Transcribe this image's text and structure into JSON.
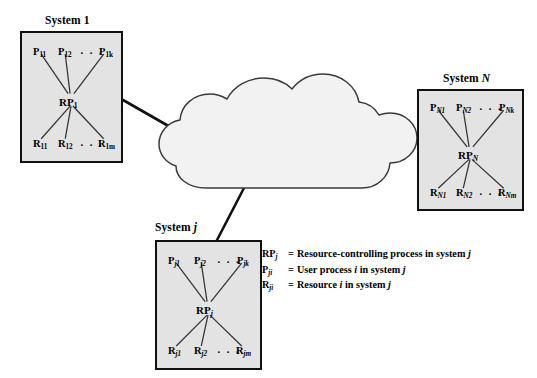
{
  "figure": {
    "background_color": "#ffffff",
    "box_fill": "#e3e3e3",
    "line_color": "#111111"
  },
  "cloud": {
    "label": "network-cloud",
    "fill": "#f2f2f2",
    "stroke": "#3a3a3a"
  },
  "systems": [
    {
      "id": "system-1",
      "title_prefix": "System",
      "title_index": "1",
      "title_index_italic": false,
      "processes": [
        {
          "base": "P",
          "sub": "11"
        },
        {
          "base": "P",
          "sub": "12"
        },
        {
          "base": "P",
          "sub": "1k"
        }
      ],
      "process_dots": "· · ·",
      "controller": {
        "base": "RP",
        "sub": "1",
        "sub_italic": false
      },
      "resources": [
        {
          "base": "R",
          "sub": "11"
        },
        {
          "base": "R",
          "sub": "12"
        },
        {
          "base": "R",
          "sub": "1m"
        }
      ],
      "resource_dots": "· · ·"
    },
    {
      "id": "system-N",
      "title_prefix": "System",
      "title_index": "N",
      "title_index_italic": true,
      "processes": [
        {
          "base": "P",
          "sub": "N1"
        },
        {
          "base": "P",
          "sub": "N2"
        },
        {
          "base": "P",
          "sub": "Nk"
        }
      ],
      "process_dots": "· · ·",
      "controller": {
        "base": "RP",
        "sub": "N",
        "sub_italic": true
      },
      "resources": [
        {
          "base": "R",
          "sub": "N1"
        },
        {
          "base": "R",
          "sub": "N2"
        },
        {
          "base": "R",
          "sub": "Nm"
        }
      ],
      "resource_dots": "· · ·"
    },
    {
      "id": "system-j",
      "title_prefix": "System",
      "title_index": "j",
      "title_index_italic": true,
      "processes": [
        {
          "base": "P",
          "sub": "j1"
        },
        {
          "base": "P",
          "sub": "j2"
        },
        {
          "base": "P",
          "sub": "jk"
        }
      ],
      "process_dots": "· · ·",
      "controller": {
        "base": "RP",
        "sub": "j",
        "sub_italic": true
      },
      "resources": [
        {
          "base": "R",
          "sub": "j1"
        },
        {
          "base": "R",
          "sub": "j2"
        },
        {
          "base": "R",
          "sub": "jm"
        }
      ],
      "resource_dots": "· · ·"
    }
  ],
  "legend": [
    {
      "symbol_base": "RP",
      "symbol_sub": "j",
      "equals": "=",
      "text_parts": [
        "Resource-controlling process in system ",
        "j",
        ""
      ]
    },
    {
      "symbol_base": "P",
      "symbol_sub": "ji",
      "equals": "=",
      "text_parts": [
        "User process ",
        "i",
        " in system "
      ],
      "text_tail_italic": "j"
    },
    {
      "symbol_base": "R",
      "symbol_sub": "ji",
      "equals": "=",
      "text_parts": [
        "Resource ",
        "i",
        " in system "
      ],
      "text_tail_italic": "j"
    }
  ]
}
